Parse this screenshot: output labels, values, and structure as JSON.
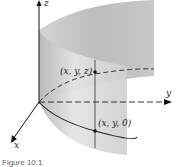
{
  "figure": {
    "axes": {
      "x_label": "x",
      "y_label": "y",
      "z_label": "z"
    },
    "points": [
      {
        "label": "(x, y, z)"
      },
      {
        "label": "(x, y, 0)"
      }
    ],
    "caption": "Figure 10.1"
  }
}
